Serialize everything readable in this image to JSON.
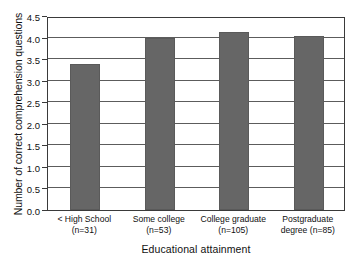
{
  "chart_data": {
    "type": "bar",
    "title": "",
    "subtitle": "",
    "xlabel": "Educational attainment",
    "ylabel": "Number of correct comprehension questions",
    "categories": [
      "< High School (n=31)",
      "Some college (n=53)",
      "College graduate (n=105)",
      "Postgraduate degree (n=85)"
    ],
    "category_lines": [
      [
        "< High School",
        "(n=31)"
      ],
      [
        "Some college",
        "(n=53)"
      ],
      [
        "College graduate",
        "(n=105)"
      ],
      [
        "Postgraduate",
        "degree (n=85)"
      ]
    ],
    "values": [
      3.38,
      4.0,
      4.14,
      4.03
    ],
    "sample_sizes": [
      31,
      53,
      105,
      85
    ],
    "ylim": [
      0.0,
      4.5
    ],
    "xlim": [
      0,
      4
    ],
    "ytick_labels": [
      "0.0",
      "0.5",
      "1.0",
      "1.5",
      "2.0",
      "2.5",
      "3.0",
      "3.5",
      "4.0",
      "4.5"
    ],
    "ytick_values": [
      0.0,
      0.5,
      1.0,
      1.5,
      2.0,
      2.5,
      3.0,
      3.5,
      4.0,
      4.5
    ],
    "grid": true,
    "grid_axis": "y",
    "legend": false,
    "legend_position": "none",
    "bar_color": "#666666",
    "bar_edge_color": "#5a5a5a",
    "frame_color": "#3a3a3a",
    "background_color": "#ffffff",
    "text_color": "#111111"
  }
}
